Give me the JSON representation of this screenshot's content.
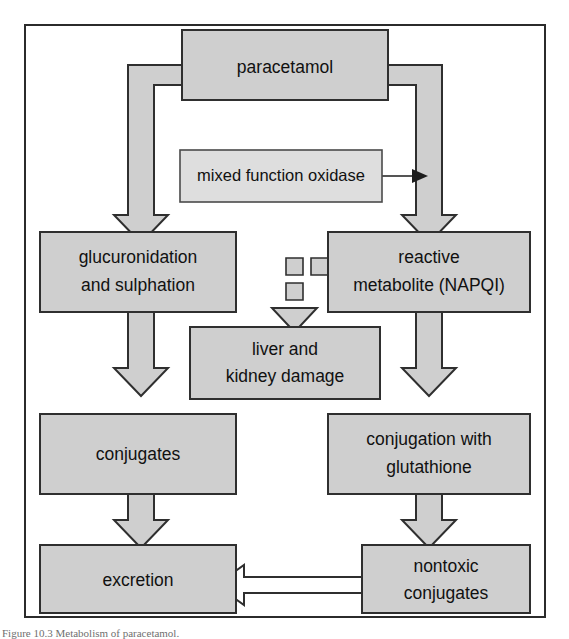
{
  "figure": {
    "caption": "Figure 10.3 Metabolism of paracetamol.",
    "frame_color": "#2b2b2b",
    "node_fill": "#cfcfcf",
    "node_light_fill": "#dedede",
    "node_stroke": "#2f2f2f",
    "arrow_fill": "#cfcfcf",
    "hollow_arrow_fill": "#ffffff",
    "text_color": "#111111"
  },
  "nodes": {
    "paracetamol": {
      "label": "paracetamol"
    },
    "mixed_function_oxidase": {
      "label": "mixed function oxidase"
    },
    "glucuronidation": {
      "line1": "glucuronidation",
      "line2": "and sulphation"
    },
    "reactive_metabolite": {
      "line1": "reactive",
      "line2": "metabolite (NAPQI)"
    },
    "liver_kidney_damage": {
      "line1": "liver and",
      "line2": "kidney damage"
    },
    "conjugates": {
      "label": "conjugates"
    },
    "conjugation_glutathione": {
      "line1": "conjugation with",
      "line2": "glutathione"
    },
    "excretion": {
      "label": "excretion"
    },
    "nontoxic_conjugates": {
      "line1": "nontoxic",
      "line2": "conjugates"
    }
  },
  "edges": [
    {
      "from": "paracetamol",
      "to": "glucuronidation",
      "style": "block-elbow-left"
    },
    {
      "from": "paracetamol",
      "to": "reactive_metabolite",
      "style": "block-elbow-right"
    },
    {
      "from": "mixed_function_oxidase",
      "to": "paracetamol_right_arrow",
      "style": "thin-line"
    },
    {
      "from": "reactive_metabolite",
      "to": "liver_kidney_damage",
      "style": "dashed-block"
    },
    {
      "from": "glucuronidation",
      "to": "conjugates",
      "style": "block-down"
    },
    {
      "from": "reactive_metabolite",
      "to": "conjugation_glutathione",
      "style": "block-down"
    },
    {
      "from": "conjugates",
      "to": "excretion",
      "style": "block-down"
    },
    {
      "from": "conjugation_glutathione",
      "to": "nontoxic_conjugates",
      "style": "block-down"
    },
    {
      "from": "nontoxic_conjugates",
      "to": "excretion",
      "style": "hollow-left"
    }
  ]
}
